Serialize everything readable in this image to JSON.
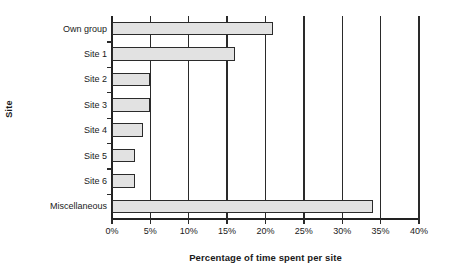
{
  "chart_data": {
    "type": "bar",
    "orientation": "horizontal",
    "title": "",
    "xlabel": "Percentage of time spent per site",
    "ylabel": "Site",
    "categories": [
      "Own group",
      "Site 1",
      "Site 2",
      "Site 3",
      "Site 4",
      "Site 5",
      "Site 6",
      "Miscellaneous"
    ],
    "values": [
      21,
      16,
      5,
      5,
      4,
      3,
      3,
      34
    ],
    "xlim": [
      0,
      40
    ],
    "xticks": [
      0,
      5,
      10,
      15,
      20,
      25,
      30,
      35,
      40
    ],
    "xtick_labels": [
      "0%",
      "5%",
      "10%",
      "15%",
      "20%",
      "25%",
      "30%",
      "35%",
      "40%"
    ],
    "grid": "vertical",
    "legend": "none",
    "bar_fill_color": "#e2e2e2",
    "bar_edge_color": "#2b2b2b",
    "axis_color": "#2a2a2a"
  }
}
